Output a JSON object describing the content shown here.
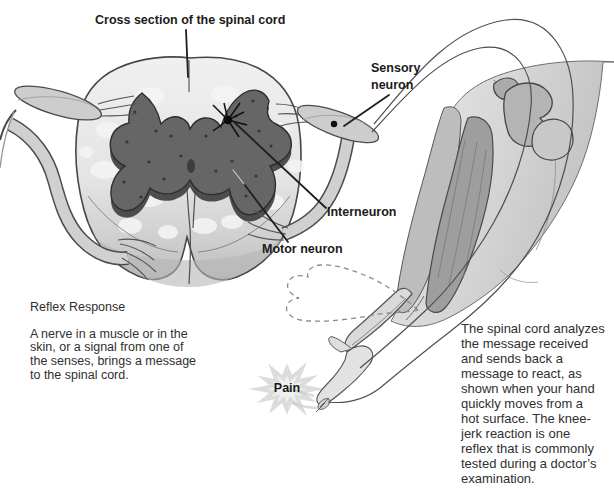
{
  "figure": {
    "title": "Cross section of the spinal cord",
    "labels": {
      "sensory_neuron": "Sensory\nneuron",
      "interneuron": "Interneuron",
      "motor_neuron": "Motor neuron",
      "pain": "Pain"
    },
    "reflex_caption": {
      "heading": "Reflex Response",
      "body": "A nerve in a muscle or in the\nskin, or a signal from one of\nthe senses, brings a message\nto the spinal cord."
    },
    "response_caption": "The spinal cord analyzes\nthe message received\nand sends back a\nmessage to react, as\nshown when your hand\nquickly moves from a\nhot surface. The knee-\njerk reaction is one\nreflex that is commonly\ntested during a doctor’s\nexamination.",
    "colors": {
      "background": "#ffffff",
      "label_text": "#1b1b1b",
      "body_text": "#2f2f2f",
      "white_matter": "#e7e7e7",
      "gray_matter": "#666666",
      "outline": "#474747",
      "nerve": "#cecece",
      "starburst": "#dcdcdc"
    }
  }
}
